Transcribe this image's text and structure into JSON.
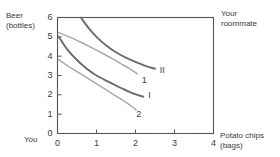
{
  "figure": {
    "y_axis_title": "Beer\n(bottles)",
    "x_axis_title": "Potato chips\n(bags)",
    "origin_label": "You",
    "corner_label": "Your\nroommate"
  },
  "chart_data": {
    "type": "line",
    "title": "",
    "xlabel": "Potato chips (bags)",
    "ylabel": "Beer (bottles)",
    "xlim": [
      0,
      4
    ],
    "ylim": [
      0,
      6
    ],
    "xticks": [
      0,
      1,
      2,
      3,
      4
    ],
    "yticks": [
      0,
      1,
      2,
      3,
      4,
      5,
      6
    ],
    "xtick_labels": [
      "0",
      "1",
      "2",
      "3",
      "4"
    ],
    "ytick_labels": [
      "0",
      "1",
      "2",
      "3",
      "4",
      "5",
      "6"
    ],
    "grid": false,
    "legend": "none",
    "frame": "box",
    "colors": {
      "dark_curve": "#6c6c6c",
      "light_curve": "#a9a9a9",
      "axis": "#555555",
      "text": "#3a3a3a"
    },
    "series": [
      {
        "name": "II",
        "label": "II",
        "style": "dark",
        "label_x": 2.62,
        "label_y": 3.25,
        "points": [
          [
            0.6,
            6.0
          ],
          [
            0.8,
            5.45
          ],
          [
            1.0,
            5.0
          ],
          [
            1.25,
            4.55
          ],
          [
            1.5,
            4.2
          ],
          [
            1.75,
            3.92
          ],
          [
            2.0,
            3.7
          ],
          [
            2.25,
            3.5
          ],
          [
            2.5,
            3.35
          ]
        ]
      },
      {
        "name": "1",
        "label": "1",
        "style": "light",
        "label_x": 2.16,
        "label_y": 2.7,
        "points": [
          [
            0.03,
            5.22
          ],
          [
            0.3,
            5.0
          ],
          [
            0.6,
            4.72
          ],
          [
            0.9,
            4.42
          ],
          [
            1.2,
            4.1
          ],
          [
            1.45,
            3.82
          ],
          [
            1.65,
            3.58
          ],
          [
            1.85,
            3.35
          ],
          [
            2.05,
            3.08
          ]
        ]
      },
      {
        "name": "I",
        "label": "I",
        "style": "dark",
        "label_x": 2.33,
        "label_y": 1.92,
        "points": [
          [
            0.03,
            5.02
          ],
          [
            0.25,
            4.35
          ],
          [
            0.5,
            3.8
          ],
          [
            0.75,
            3.35
          ],
          [
            1.0,
            3.0
          ],
          [
            1.3,
            2.68
          ],
          [
            1.6,
            2.38
          ],
          [
            1.9,
            2.1
          ],
          [
            2.2,
            1.9
          ]
        ]
      },
      {
        "name": "2",
        "label": "2",
        "style": "light",
        "label_x": 2.02,
        "label_y": 0.95,
        "points": [
          [
            0.03,
            3.82
          ],
          [
            0.3,
            3.45
          ],
          [
            0.6,
            3.08
          ],
          [
            0.9,
            2.7
          ],
          [
            1.2,
            2.32
          ],
          [
            1.45,
            2.0
          ],
          [
            1.65,
            1.75
          ],
          [
            1.85,
            1.48
          ],
          [
            2.02,
            1.22
          ]
        ]
      }
    ]
  }
}
